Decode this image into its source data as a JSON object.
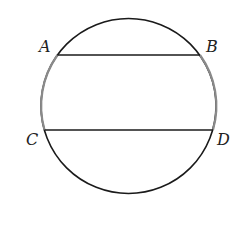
{
  "diagram": {
    "type": "circle-with-parallel-chords",
    "points": {
      "A": {
        "label": "A",
        "x": 57,
        "y": 55
      },
      "B": {
        "label": "B",
        "x": 202,
        "y": 55
      },
      "C": {
        "label": "C",
        "x": 44,
        "y": 130
      },
      "D": {
        "label": "D",
        "x": 213,
        "y": 130
      }
    },
    "chords": [
      "AB",
      "CD"
    ],
    "highlighted_arcs": [
      "AC",
      "BD"
    ],
    "colors": {
      "circle": "#1a1a1a",
      "highlight_arc": "#8a8a8a",
      "chord": "#1a1a1a"
    }
  }
}
